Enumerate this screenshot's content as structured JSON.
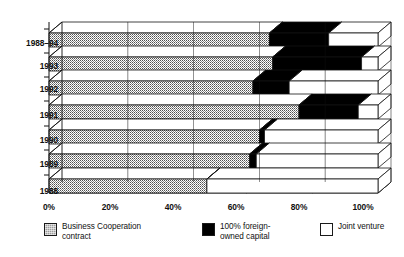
{
  "chart_data": {
    "type": "bar",
    "orientation": "horizontal",
    "stacked": true,
    "stacked_normalized": true,
    "three_d": true,
    "title": "",
    "subtitle": "",
    "xlabel": "",
    "ylabel": "",
    "xlim": [
      0,
      100
    ],
    "grid": false,
    "legend_position": "bottom",
    "categories": [
      "1988–94",
      "1993",
      "1992",
      "1991",
      "1990",
      "1989",
      "1988"
    ],
    "xticks": [
      0,
      20,
      40,
      60,
      80,
      100
    ],
    "xticklabels": [
      "0%",
      "20%",
      "40%",
      "60%",
      "80%",
      "100%"
    ],
    "series": [
      {
        "name": "Business Cooperation contract",
        "color": "#9d9d9d",
        "values": [
          67,
          68,
          62,
          76,
          64,
          61,
          48
        ]
      },
      {
        "name": "100% foreign-owned capital",
        "color": "#000000",
        "values": [
          18,
          27,
          11,
          18,
          1.5,
          2,
          0
        ]
      },
      {
        "name": "Joint venture",
        "color": "#ffffff",
        "values": [
          15,
          5,
          27,
          6,
          34.5,
          37,
          52
        ]
      }
    ],
    "annotations": []
  },
  "legend": {
    "items": [
      {
        "label": "Business Cooperation\ncontract",
        "swatch": "gray-stipple-swatch"
      },
      {
        "label": "100% foreign-\nowned capital",
        "swatch": "black-swatch"
      },
      {
        "label": "Joint venture",
        "swatch": "white-swatch"
      }
    ]
  },
  "axis": {
    "x_labels": [
      "0%",
      "20%",
      "40%",
      "60%",
      "80%",
      "100%"
    ],
    "y_labels": [
      "1988–94",
      "1993",
      "1992",
      "1991",
      "1990",
      "1989",
      "1988"
    ]
  },
  "colors": {
    "gray": "#9d9d9d",
    "black": "#000000",
    "white": "#ffffff",
    "outline": "#111111",
    "background": "#ffffff"
  }
}
